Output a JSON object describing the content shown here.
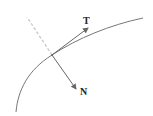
{
  "diagram": {
    "labels": {
      "tangent": "T",
      "normal": "N"
    },
    "colors": {
      "curve": "#777777",
      "vector": "#666666",
      "dashed_extension": "#c8c8c8",
      "label": "#222222",
      "background": "#ffffff"
    }
  }
}
